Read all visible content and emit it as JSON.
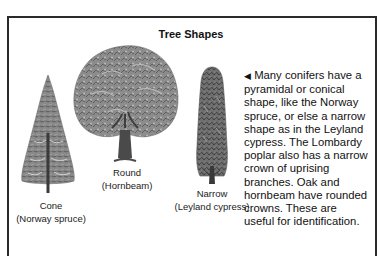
{
  "panel": {
    "title": "Tree Shapes",
    "trees": [
      {
        "shape": "Cone",
        "species": "(Norway spruce)",
        "icon": "conical-tree-illustration"
      },
      {
        "shape": "Round",
        "species": "(Hornbeam)",
        "icon": "round-tree-illustration"
      },
      {
        "shape": "Narrow",
        "species": "(Leyland cypress)",
        "icon": "narrow-tree-illustration"
      }
    ],
    "description_marker": "◀",
    "description": " Many conifers have a\npyramidal or conical\nshape, like the Norway\nspruce, or else a narrow\nshape as in the Leyland\ncypress. The Lombardy\npoplar also has a narrow\ncrown of uprising\nbranches. Oak and\nhornbeam have rounded\ncrowns. These are\nuseful for identification."
  },
  "colors": {
    "border": "#2a2a2a",
    "foliage_dark": "#4a4a4a",
    "foliage_mid": "#7a7a7a",
    "foliage_light": "#a8a8a8"
  }
}
